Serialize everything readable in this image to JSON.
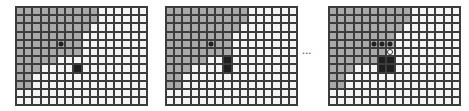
{
  "figure": {
    "grid_cols": 16,
    "grid_rows": 12,
    "colors": {
      "grid_line": "#3c3c3c",
      "gray_cell": "#a9a9a9",
      "white_cell": "#f4f4f4",
      "marker": "#1e1e1e"
    },
    "ellipsis": "...",
    "panels": [
      {
        "id": "panel-1",
        "left": 15,
        "gray_extent_per_row": [
          10,
          10,
          9,
          8,
          8,
          8,
          5,
          3,
          2,
          2,
          0,
          0
        ],
        "markers": [
          {
            "type": "dot",
            "row": 4,
            "col": 5
          },
          {
            "type": "square",
            "row": 7,
            "col": 7
          }
        ]
      },
      {
        "id": "panel-2",
        "left": 165,
        "gray_extent_per_row": [
          10,
          10,
          9,
          8,
          8,
          8,
          5,
          3,
          2,
          2,
          0,
          0
        ],
        "markers": [
          {
            "type": "dot",
            "row": 4,
            "col": 5
          },
          {
            "type": "square",
            "row": 6,
            "col": 7
          },
          {
            "type": "square",
            "row": 7,
            "col": 7
          }
        ]
      },
      {
        "id": "panel-3",
        "left": 328,
        "gray_extent_per_row": [
          10,
          10,
          9,
          8,
          8,
          7,
          6,
          3,
          2,
          2,
          0,
          0
        ],
        "markers": [
          {
            "type": "dot",
            "row": 4,
            "col": 5
          },
          {
            "type": "dot",
            "row": 4,
            "col": 6
          },
          {
            "type": "dot",
            "row": 4,
            "col": 7
          },
          {
            "type": "hollow",
            "row": 5,
            "col": 7
          },
          {
            "type": "square",
            "row": 6,
            "col": 6
          },
          {
            "type": "square",
            "row": 6,
            "col": 7
          },
          {
            "type": "square",
            "row": 7,
            "col": 6
          },
          {
            "type": "square",
            "row": 7,
            "col": 7
          }
        ]
      }
    ]
  }
}
